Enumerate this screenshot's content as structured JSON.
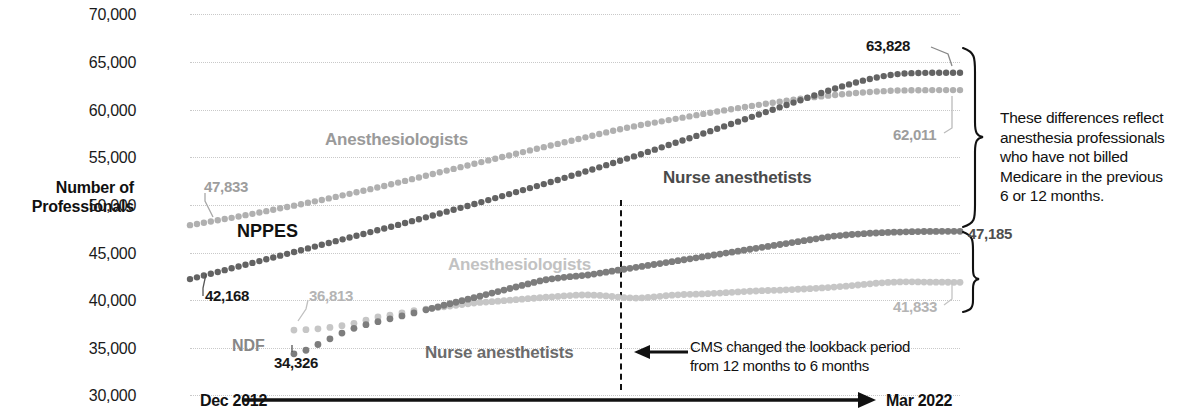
{
  "axis": {
    "y_title": "Number of\nProfessionals",
    "y_title_line1": "Number of",
    "y_title_line2": "Professionals",
    "y_ticks": [
      "70,000",
      "65,000",
      "60,000",
      "55,000",
      "50,000",
      "45,000",
      "40,000",
      "35,000",
      "30,000"
    ],
    "x_start": "Dec 2012",
    "x_end": "Mar 2022"
  },
  "labels": {
    "nppes": "NPPES",
    "ndf": "NDF",
    "anesthesiologists_top": "Anesthesiologists",
    "nurse_anesthetists_top": "Nurse anesthetists",
    "anesthesiologists_bottom": "Anesthesiologists",
    "nurse_anesthetists_bottom": "Nurse anesthetists"
  },
  "callouts": {
    "nppes_anes_start": "47,833",
    "nppes_nurse_start": "42,168",
    "ndf_anes_start": "36,813",
    "ndf_nurse_start": "34,326",
    "nppes_nurse_end": "63,828",
    "nppes_anes_end": "62,011",
    "ndf_nurse_end": "47,185",
    "ndf_anes_end": "41,833"
  },
  "annotations": {
    "right_note_l1": "These differences reflect",
    "right_note_l2": "anesthesia professionals",
    "right_note_l3": "who have not billed",
    "right_note_l4": "Medicare in the previous",
    "right_note_l5": "6 or 12 months.",
    "cms_note_l1": "CMS changed the lookback period",
    "cms_note_l2": "from 12 months to 6 months"
  },
  "colors": {
    "nppes_anesthesiologists": "#b0b0b0",
    "nppes_nurse_anesthetists": "#636363",
    "ndf_anesthesiologists": "#c6c6c6",
    "ndf_nurse_anesthetists": "#7d7d7d",
    "gridline": "#c9c9c9",
    "axis_text": "#1a1a1a",
    "vline": "#111111"
  },
  "chart_data": {
    "type": "scatter",
    "title": "",
    "xlabel": "",
    "ylabel": "Number of Professionals",
    "ylim": [
      30000,
      70000
    ],
    "ytick_values": [
      30000,
      35000,
      40000,
      45000,
      50000,
      55000,
      60000,
      65000,
      70000
    ],
    "grid": true,
    "legend_position": "inline-labels",
    "x_range": [
      "Dec 2012",
      "Mar 2022"
    ],
    "x_months": 112,
    "annotations": [
      {
        "text": "CMS changed the lookback period from 12 months to 6 months",
        "x_index": 88,
        "type": "vertical-dashed-line"
      },
      {
        "text": "These differences reflect anesthesia professionals who have not billed Medicare in the previous 6 or 12 months.",
        "type": "brace-note"
      }
    ],
    "series": [
      {
        "name": "NPPES Anesthesiologists",
        "source": "NPPES",
        "color": "#b0b0b0",
        "start_value": 47833,
        "end_value": 62011,
        "values": [
          47833,
          47950,
          48080,
          48210,
          48340,
          48470,
          48600,
          48740,
          48880,
          49020,
          49160,
          49300,
          49450,
          49600,
          49740,
          49880,
          50030,
          50180,
          50330,
          50480,
          50640,
          50800,
          50960,
          51120,
          51280,
          51440,
          51610,
          51780,
          51950,
          52120,
          52300,
          52480,
          52660,
          52840,
          53020,
          53200,
          53380,
          53560,
          53740,
          53920,
          54100,
          54280,
          54450,
          54630,
          54800,
          54980,
          55150,
          55330,
          55500,
          55680,
          55850,
          56020,
          56190,
          56360,
          56530,
          56700,
          56880,
          57050,
          57220,
          57400,
          57570,
          57740,
          57900,
          58050,
          58200,
          58340,
          58470,
          58600,
          58730,
          58860,
          58990,
          59120,
          59250,
          59380,
          59510,
          59640,
          59760,
          59880,
          60000,
          60120,
          60240,
          60350,
          60460,
          60570,
          60680,
          60790,
          60900,
          61000,
          61100,
          61190,
          61270,
          61350,
          61430,
          61500,
          61570,
          61640,
          61700,
          61760,
          61810,
          61860,
          61900,
          61940,
          61965,
          61980,
          61990,
          62000,
          62005,
          62008,
          62010,
          62010,
          62011,
          62011
        ]
      },
      {
        "name": "NPPES Nurse anesthetists",
        "source": "NPPES",
        "color": "#636363",
        "start_value": 42168,
        "end_value": 63828,
        "values": [
          42168,
          42350,
          42540,
          42730,
          42920,
          43110,
          43300,
          43490,
          43680,
          43870,
          44060,
          44250,
          44440,
          44630,
          44820,
          45010,
          45200,
          45390,
          45580,
          45770,
          45960,
          46150,
          46340,
          46530,
          46720,
          46910,
          47100,
          47290,
          47480,
          47670,
          47860,
          48050,
          48250,
          48450,
          48650,
          48850,
          49050,
          49250,
          49450,
          49650,
          49850,
          50050,
          50250,
          50460,
          50670,
          50880,
          51090,
          51300,
          51510,
          51720,
          51930,
          52140,
          52360,
          52580,
          52800,
          53020,
          53240,
          53460,
          53680,
          53900,
          54130,
          54360,
          54590,
          54820,
          55050,
          55280,
          55520,
          55760,
          56000,
          56240,
          56480,
          56720,
          56960,
          57200,
          57450,
          57700,
          57950,
          58200,
          58450,
          58700,
          58950,
          59200,
          59450,
          59700,
          59950,
          60200,
          60450,
          60700,
          60950,
          61200,
          61450,
          61700,
          61950,
          62180,
          62400,
          62610,
          62810,
          63000,
          63180,
          63340,
          63480,
          63600,
          63690,
          63750,
          63790,
          63810,
          63820,
          63825,
          63827,
          63828,
          63828,
          63828
        ]
      },
      {
        "name": "NDF Anesthesiologists",
        "source": "NDF",
        "color": "#c6c6c6",
        "start_value": 36813,
        "end_value": 41833,
        "values": [
          36813,
          36830,
          36860,
          36900,
          36950,
          37020,
          37090,
          37180,
          37280,
          37400,
          37530,
          37680,
          37850,
          38050,
          38200,
          38300,
          38380,
          38480,
          38620,
          38740,
          38860,
          38950,
          39020,
          39100,
          39180,
          39260,
          39340,
          39420,
          39500,
          39580,
          39660,
          39720,
          39760,
          39800,
          39850,
          39900,
          39960,
          40010,
          40060,
          40110,
          40160,
          40210,
          40260,
          40300,
          40350,
          40400,
          40440,
          40480,
          40500,
          40510,
          40480,
          40450,
          40400,
          40340,
          40280,
          40230,
          40200,
          40180,
          40200,
          40240,
          40300,
          40360,
          40420,
          40480,
          40520,
          40550,
          40570,
          40590,
          40610,
          40640,
          40670,
          40700,
          40740,
          40780,
          40820,
          40860,
          40890,
          40920,
          40950,
          40970,
          40990,
          41010,
          41040,
          41070,
          41100,
          41130,
          41160,
          41200,
          41240,
          41280,
          41330,
          41380,
          41430,
          41490,
          41550,
          41610,
          41670,
          41730,
          41780,
          41820,
          41850,
          41870,
          41880,
          41880,
          41870,
          41860,
          41850,
          41845,
          41840,
          41836,
          41834,
          41833
        ]
      },
      {
        "name": "NDF Nurse anesthetists",
        "source": "NDF",
        "color": "#7d7d7d",
        "start_value": 34326,
        "end_value": 47185,
        "values": [
          34326,
          34400,
          34700,
          35000,
          35300,
          35600,
          35900,
          36200,
          36500,
          36750,
          37000,
          37200,
          37380,
          37550,
          37700,
          37850,
          38000,
          38150,
          38300,
          38460,
          38620,
          38780,
          38940,
          39100,
          39260,
          39420,
          39580,
          39740,
          39900,
          40060,
          40220,
          40380,
          40540,
          40700,
          40860,
          41020,
          41180,
          41340,
          41500,
          41660,
          41820,
          41980,
          42100,
          42200,
          42280,
          42350,
          42420,
          42480,
          42540,
          42600,
          42700,
          42800,
          42900,
          43000,
          43100,
          43200,
          43300,
          43400,
          43500,
          43600,
          43700,
          43800,
          43900,
          44000,
          44100,
          44200,
          44300,
          44400,
          44500,
          44600,
          44700,
          44800,
          44900,
          45000,
          45100,
          45200,
          45300,
          45400,
          45500,
          45600,
          45700,
          45800,
          45900,
          46000,
          46100,
          46200,
          46300,
          46400,
          46500,
          46600,
          46680,
          46740,
          46800,
          46850,
          46900,
          46940,
          46980,
          47010,
          47040,
          47070,
          47090,
          47110,
          47130,
          47145,
          47155,
          47165,
          47172,
          47177,
          47180,
          47183,
          47184,
          47185
        ]
      }
    ]
  }
}
